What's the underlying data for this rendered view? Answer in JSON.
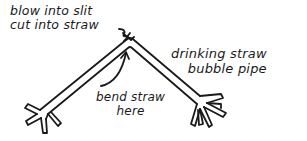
{
  "figure": {
    "type": "hand-drawn instructional diagram",
    "subject": "drinking straw bubble pipe",
    "line_color": "#1a1a1a",
    "background": "#ffffff"
  },
  "labels": {
    "title": {
      "line1": "drinking straw",
      "line2": "bubble pipe"
    },
    "blow_instruction": {
      "line1": "blow into slit",
      "line2": "cut into straw"
    },
    "bend_instruction": {
      "line1": "bend straw",
      "line2": "here"
    }
  },
  "parts": {
    "straw": "bent drinking straw (inverted V)",
    "slit": "slit at top of bend",
    "left_end": "split end (left)",
    "right_end": "split end (right)",
    "arrows": [
      "arrow to slit",
      "curved arrow to bend"
    ]
  }
}
